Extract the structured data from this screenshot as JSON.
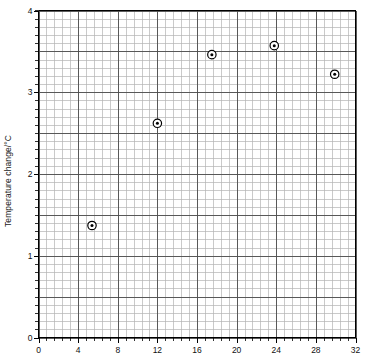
{
  "chart_data": {
    "type": "scatter",
    "title": "",
    "xlabel": "",
    "ylabel": "Temperature change/°C",
    "xlim": [
      0,
      32
    ],
    "ylim": [
      0,
      4
    ],
    "xticks": [
      0,
      4,
      8,
      12,
      16,
      20,
      24,
      28,
      32
    ],
    "yticks": [
      0,
      1,
      2,
      3,
      4
    ],
    "xtick_labels": [
      "0",
      "4",
      "8",
      "12",
      "16",
      "20",
      "24",
      "28",
      "32"
    ],
    "ytick_labels": [
      "0",
      "1",
      "2",
      "3",
      "4"
    ],
    "x_minor_step": 0.8,
    "y_minor_step": 0.1,
    "grid": true,
    "grid_minor": true,
    "legend": null,
    "marker": "circle-with-center-dot",
    "points": [
      {
        "x": 5.4,
        "y": 1.37
      },
      {
        "x": 12.0,
        "y": 2.62
      },
      {
        "x": 17.5,
        "y": 3.46
      },
      {
        "x": 23.8,
        "y": 3.57
      },
      {
        "x": 29.9,
        "y": 3.22
      }
    ],
    "colors": {
      "axis": "#000000",
      "grid_major": "#4d4d4d",
      "grid_minor": "#b3b3b3",
      "marker": "#000000",
      "background": "#ffffff"
    }
  }
}
